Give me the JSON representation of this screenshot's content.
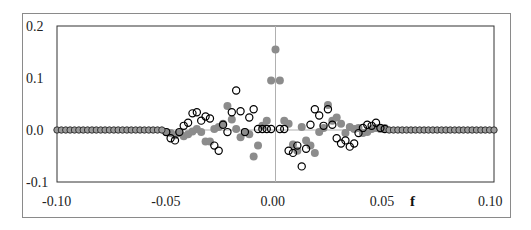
{
  "chart_data": {
    "type": "scatter",
    "title": "",
    "xlabel": "f",
    "ylabel": "",
    "xlim": [
      -0.1,
      0.1
    ],
    "ylim": [
      -0.1,
      0.2
    ],
    "x_ticks": [
      "-0.10",
      "-0.05",
      "0.00",
      "0.05",
      "0.10"
    ],
    "y_ticks": [
      "0.2",
      "0.1",
      "0.0",
      "-0.1"
    ],
    "grid": false,
    "zero_lines": true,
    "legend": null,
    "series": [
      {
        "name": "filled",
        "marker": "filled-circle",
        "color": "#8c8c8c",
        "points": [
          [
            -0.05,
            -0.004
          ],
          [
            -0.048,
            -0.006
          ],
          [
            -0.046,
            -0.01
          ],
          [
            -0.044,
            -0.006
          ],
          [
            -0.042,
            -0.012
          ],
          [
            -0.04,
            -0.008
          ],
          [
            -0.038,
            -0.003
          ],
          [
            -0.036,
            0.002
          ],
          [
            -0.034,
            -0.004
          ],
          [
            -0.032,
            -0.022
          ],
          [
            -0.03,
            -0.022
          ],
          [
            -0.028,
            0.002
          ],
          [
            -0.026,
            0.006
          ],
          [
            -0.024,
            0.012
          ],
          [
            -0.022,
            0.046
          ],
          [
            -0.02,
            0.02
          ],
          [
            -0.018,
            0.002
          ],
          [
            -0.016,
            -0.014
          ],
          [
            -0.014,
            -0.004
          ],
          [
            -0.012,
            -0.008
          ],
          [
            -0.01,
            -0.051
          ],
          [
            -0.008,
            -0.03
          ],
          [
            -0.006,
            0.008
          ],
          [
            -0.004,
            0.018
          ],
          [
            -0.002,
            0.095
          ],
          [
            0.0,
            0.155
          ],
          [
            0.002,
            0.095
          ],
          [
            0.004,
            0.018
          ],
          [
            0.006,
            0.012
          ],
          [
            0.008,
            -0.028
          ],
          [
            0.01,
            -0.04
          ],
          [
            0.012,
            0.006
          ],
          [
            0.014,
            -0.02
          ],
          [
            0.016,
            -0.03
          ],
          [
            0.018,
            -0.044
          ],
          [
            0.02,
            -0.004
          ],
          [
            0.022,
            0.004
          ],
          [
            0.024,
            0.048
          ],
          [
            0.026,
            0.018
          ],
          [
            0.028,
            0.024
          ],
          [
            0.03,
            0.012
          ],
          [
            0.032,
            -0.006
          ],
          [
            0.034,
            0.006
          ],
          [
            0.036,
            0.002
          ],
          [
            0.038,
            0.004
          ],
          [
            0.04,
            -0.006
          ],
          [
            0.042,
            -0.004
          ],
          [
            0.044,
            0.002
          ],
          [
            0.046,
            0.004
          ],
          [
            0.048,
            0.002
          ],
          [
            0.05,
            0.004
          ]
        ]
      },
      {
        "name": "open",
        "marker": "open-circle",
        "color": "#000000",
        "points": [
          [
            -0.05,
            -0.004
          ],
          [
            -0.048,
            -0.016
          ],
          [
            -0.046,
            -0.02
          ],
          [
            -0.044,
            -0.004
          ],
          [
            -0.042,
            0.008
          ],
          [
            -0.04,
            0.014
          ],
          [
            -0.038,
            0.032
          ],
          [
            -0.036,
            0.034
          ],
          [
            -0.034,
            0.018
          ],
          [
            -0.032,
            0.026
          ],
          [
            -0.03,
            0.022
          ],
          [
            -0.028,
            -0.03
          ],
          [
            -0.026,
            -0.04
          ],
          [
            -0.024,
            0.01
          ],
          [
            -0.022,
            -0.004
          ],
          [
            -0.02,
            0.034
          ],
          [
            -0.018,
            0.076
          ],
          [
            -0.016,
            0.036
          ],
          [
            -0.014,
            -0.004
          ],
          [
            -0.012,
            0.024
          ],
          [
            -0.01,
            0.04
          ],
          [
            -0.008,
            0.002
          ],
          [
            -0.006,
            0.002
          ],
          [
            -0.004,
            0.002
          ],
          [
            -0.002,
            0.002
          ],
          [
            0.002,
            0.002
          ],
          [
            0.004,
            0.002
          ],
          [
            0.006,
            -0.04
          ],
          [
            0.008,
            -0.044
          ],
          [
            0.01,
            -0.03
          ],
          [
            0.012,
            -0.07
          ],
          [
            0.014,
            -0.036
          ],
          [
            0.016,
            0.01
          ],
          [
            0.018,
            0.04
          ],
          [
            0.02,
            0.028
          ],
          [
            0.022,
            0.008
          ],
          [
            0.024,
            0.04
          ],
          [
            0.026,
            0.01
          ],
          [
            0.028,
            -0.016
          ],
          [
            0.03,
            -0.026
          ],
          [
            0.032,
            -0.02
          ],
          [
            0.034,
            -0.032
          ],
          [
            0.036,
            -0.026
          ],
          [
            0.038,
            -0.006
          ],
          [
            0.04,
            0.004
          ],
          [
            0.042,
            0.01
          ],
          [
            0.044,
            0.008
          ],
          [
            0.046,
            0.014
          ],
          [
            0.048,
            0.004
          ],
          [
            0.05,
            0.002
          ]
        ]
      },
      {
        "name": "tails",
        "marker": "half-filled-circle",
        "color": "#555555",
        "x_left_range": [
          -0.1,
          -0.052
        ],
        "x_right_range": [
          0.052,
          0.1
        ],
        "step": 0.002,
        "y": 0.0
      }
    ]
  }
}
